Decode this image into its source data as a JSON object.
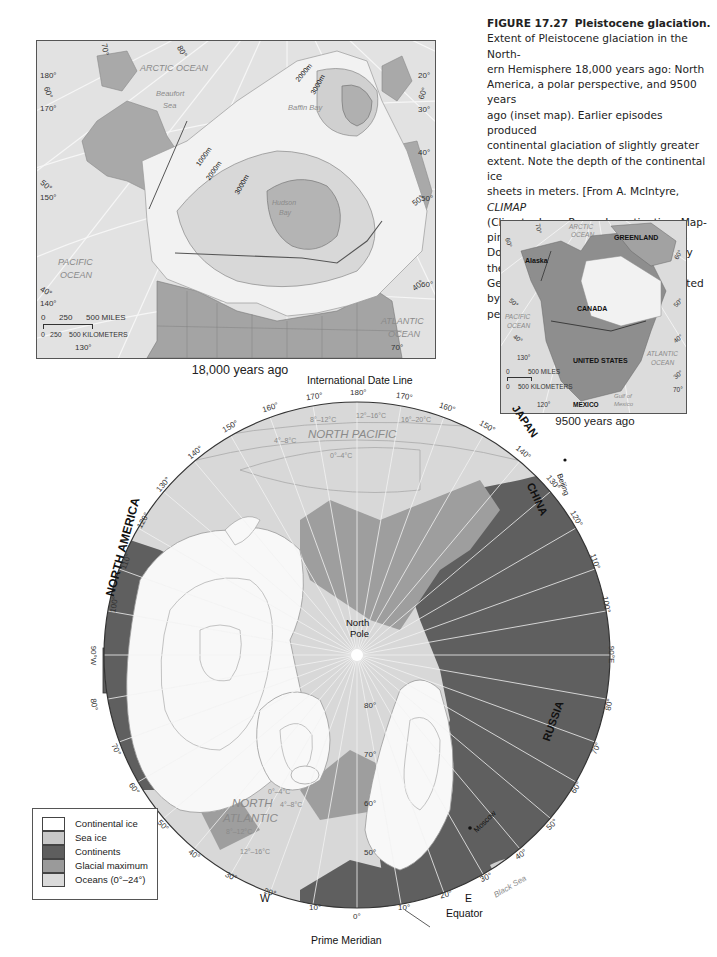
{
  "figure": {
    "number": "FIGURE 17.27",
    "title": "Pleistocene glaciation.",
    "caption_lines": [
      "Extent of Pleistocene glaciation in the North-",
      "ern Hemisphere 18,000 years ago: North",
      "America, a polar perspective, and 9500 years",
      "ago (inset map). Earlier episodes produced",
      "continental glaciation of slightly greater",
      "extent. Note the depth of the continental ice",
      "sheets in meters. [From A. McIntyre, ",
      "(Climate: Long-Range Investigation, Map-",
      "ping, and Prediction) Project, Lamont-",
      "Doherty Earth Observatory. © 1981 by the",
      "Geological Society of America. Reprinted by",
      "permission.]"
    ],
    "caption_italic": "CLIMAP"
  },
  "north_america_map": {
    "caption": "18,000 years ago",
    "ocean_labels": {
      "arctic": "ARCTIC OCEAN",
      "beaufort_1": "Beaufort",
      "beaufort_2": "Sea",
      "baffin": "Baffin Bay",
      "hudson_1": "Hudson",
      "hudson_2": "Bay",
      "pacific_1": "PACIFIC",
      "pacific_2": "OCEAN",
      "atlantic_1": "ATLANTIC",
      "atlantic_2": "OCEAN"
    },
    "ice_depths": [
      "1000m",
      "2000m",
      "3000m",
      "2000m",
      "3000m"
    ],
    "ticks": {
      "t180": "180°",
      "t170": "170°",
      "t160": "60°",
      "t150": "150°",
      "t50": "50°",
      "t140": "140°",
      "t40": "40°",
      "t130": "130°",
      "t70top": "70°",
      "t80top": "80°",
      "t20": "20°",
      "t60r": "60°",
      "t30": "30°",
      "t40r": "40°",
      "t50r": "50°",
      "t50r2": "50°",
      "t40b": "40°",
      "t60b": "60°",
      "t70b": "70°"
    },
    "scale": {
      "miles_0": "0",
      "miles_250": "250",
      "miles_500": "500 MILES",
      "km_0": "0",
      "km_250": "250",
      "km_500": "500 KILOMETERS"
    }
  },
  "inset_map": {
    "caption": "9500 years ago",
    "labels": {
      "arctic_1": "ARCTIC",
      "arctic_2": "OCEAN",
      "greenland": "GREENLAND",
      "alaska": "Alaska",
      "canada": "CANADA",
      "pacific_1": "PACIFIC",
      "pacific_2": "OCEAN",
      "us": "UNITED STATES",
      "atlantic_1": "ATLANTIC",
      "atlantic_2": "OCEAN",
      "mexico": "MEXICO",
      "gulf_1": "Gulf of",
      "gulf_2": "Mexico"
    },
    "ticks": {
      "t70": "70°",
      "t60": "60°",
      "t60r": "60°",
      "t50": "50°",
      "t50r": "50°",
      "t40": "40°",
      "t40r": "40°",
      "t130": "130°",
      "t30": "30°",
      "t70r": "70°",
      "t120": "120°"
    },
    "scale": {
      "miles_0": "0",
      "miles_500": "500 MILES",
      "km_0": "0",
      "km_500": "500 KILOMETERS"
    }
  },
  "polar_map": {
    "top_label": "International Date Line",
    "bottom_label": "Prime Meridian",
    "equator_label": "Equator",
    "west_label": "W",
    "east_label": "E",
    "pole_label_1": "North",
    "pole_label_2": "Pole",
    "region_labels": {
      "north_america": "NORTH AMERICA",
      "japan": "JAPAN",
      "china": "CHINA",
      "russia": "RUSSIA",
      "north_pacific": "NORTH PACIFIC",
      "north_atlantic_1": "NORTH",
      "north_atlantic_2": "ATLANTIC",
      "black_sea": "Black Sea"
    },
    "cities": {
      "beijing": "Beijing",
      "moscow": "Moscow"
    },
    "temperature_bands_pacific": [
      "8°–12°C",
      "12°–16°C",
      "16°–20°C",
      "4°–8°C",
      "0°–4°C"
    ],
    "temperature_bands_atlantic": [
      "0°–4°C",
      "4°–8°C",
      "8°–12°C",
      "12°–16°C"
    ],
    "latitude_ticks": [
      "80°",
      "70°",
      "60°",
      "50°"
    ],
    "longitude_ticks_west": [
      "170°",
      "160°",
      "150°",
      "140°",
      "130°",
      "120°",
      "110°",
      "100°",
      "90°W",
      "80°",
      "70°",
      "60°",
      "50°",
      "40°",
      "30°",
      "20°",
      "10°"
    ],
    "longitude_ticks_east": [
      "170°",
      "160°",
      "150°",
      "140°",
      "130°",
      "120°",
      "110°",
      "100°",
      "90°E",
      "80°",
      "70°",
      "60°",
      "50°",
      "40°",
      "30°",
      "20°",
      "10°"
    ],
    "tick_180": "180°",
    "tick_0": "0°"
  },
  "legend": {
    "items": [
      {
        "label": "Continental ice",
        "color": "#ffffff"
      },
      {
        "label": "Sea ice",
        "color": "#c8c8c8"
      },
      {
        "label": "Continents",
        "color": "#5e5e5e"
      },
      {
        "label": "Glacial maximum",
        "color": "#9a9a9a"
      },
      {
        "label": "Oceans (0°–24°)",
        "color": "#dadada"
      }
    ]
  }
}
